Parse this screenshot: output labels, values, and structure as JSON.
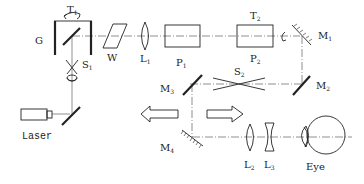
{
  "diagram": {
    "type": "optical-setup",
    "labels": {
      "G": "G",
      "T1": "T",
      "T1_sub": "1",
      "T2": "T",
      "T2_sub": "2",
      "S1": "S",
      "S1_sub": "1",
      "S2": "S",
      "S2_sub": "2",
      "W": "W",
      "L1": "L",
      "L1_sub": "1",
      "L2": "L",
      "L2_sub": "2",
      "L3": "L",
      "L3_sub": "3",
      "P1": "P",
      "P1_sub": "1",
      "P2": "P",
      "P2_sub": "2",
      "M1": "M",
      "M1_sub": "1",
      "M2": "M",
      "M2_sub": "2",
      "M3": "M",
      "M3_sub": "3",
      "M4": "M",
      "M4_sub": "4",
      "laser": "Laser",
      "eye": "Eye"
    },
    "components": [
      {
        "id": "G",
        "name": "rotating-housing"
      },
      {
        "id": "W",
        "name": "wedge-plate"
      },
      {
        "id": "L1",
        "name": "convex-lens"
      },
      {
        "id": "P1",
        "name": "prism-block"
      },
      {
        "id": "P2",
        "name": "prism-block"
      },
      {
        "id": "M1",
        "name": "mirror"
      },
      {
        "id": "M2",
        "name": "mirror"
      },
      {
        "id": "M3",
        "name": "mirror"
      },
      {
        "id": "M4",
        "name": "mirror"
      },
      {
        "id": "S1",
        "name": "beam-crossing"
      },
      {
        "id": "S2",
        "name": "beam-crossing"
      },
      {
        "id": "L2",
        "name": "convex-lens"
      },
      {
        "id": "L3",
        "name": "concave-lens"
      },
      {
        "id": "Laser",
        "name": "laser-source"
      },
      {
        "id": "Eye",
        "name": "eye"
      }
    ],
    "arrows": [
      {
        "direction": "left"
      },
      {
        "direction": "right"
      }
    ]
  }
}
